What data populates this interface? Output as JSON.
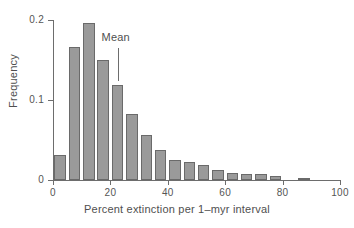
{
  "chart_data": {
    "type": "bar",
    "title": "",
    "subtitle": "",
    "xlabel": "Percent extinction per 1–myr interval",
    "ylabel": "Frequency",
    "xlim": [
      0,
      100
    ],
    "ylim": [
      0,
      0.2
    ],
    "xticks": [
      0,
      20,
      40,
      60,
      80,
      100
    ],
    "xtick_labels": [
      "0",
      "20",
      "40",
      "60",
      "80",
      "100"
    ],
    "yticks": [
      0,
      0.1,
      0.2
    ],
    "ytick_labels": [
      "0",
      "0.1",
      "0.2"
    ],
    "grid": false,
    "legend": null,
    "bin_width": 5,
    "bar_color": "#9a9a9a",
    "bar_edge_color": "#6a6a6a",
    "axis_color": "#6d6d6d",
    "categories": [
      "0–5",
      "5–10",
      "10–15",
      "15–20",
      "20–25",
      "25–30",
      "30–35",
      "35–40",
      "40–45",
      "45–50",
      "50–55",
      "55–60",
      "60–65",
      "65–70",
      "70–75",
      "75–80",
      "80–85",
      "85–90",
      "90–95",
      "95–100"
    ],
    "bin_starts": [
      0,
      5,
      10,
      15,
      20,
      25,
      30,
      35,
      40,
      45,
      50,
      55,
      60,
      65,
      70,
      75,
      80,
      85,
      90,
      95
    ],
    "values": [
      0.031,
      0.166,
      0.196,
      0.15,
      0.119,
      0.082,
      0.056,
      0.037,
      0.025,
      0.022,
      0.019,
      0.012,
      0.009,
      0.008,
      0.008,
      0.005,
      0.0,
      0.003,
      0.0,
      0.0
    ],
    "annotations": [
      {
        "name": "mean",
        "label": "Mean",
        "x": 22.5,
        "marker": "vertical-line"
      }
    ]
  }
}
